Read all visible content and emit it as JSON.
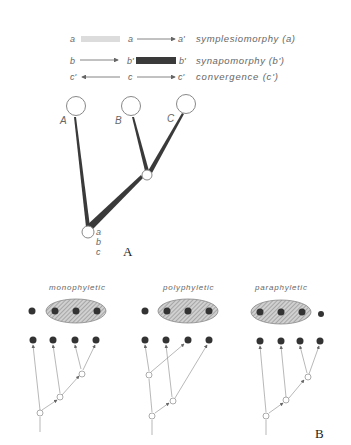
{
  "legend": {
    "rows": [
      {
        "left": "a",
        "mid": "a",
        "right": "a'",
        "term": "symplesiomorphy (a)"
      },
      {
        "left": "b",
        "mid": "b'",
        "right": "b'",
        "term": "synapomorphy (b')"
      },
      {
        "left": "c'",
        "mid": "c",
        "right": "c'",
        "term": "convergence (c')"
      }
    ]
  },
  "panel_a": {
    "label": "A",
    "taxa": [
      "A",
      "B",
      "C"
    ],
    "root_characters": [
      "a",
      "b",
      "c"
    ]
  },
  "panel_b": {
    "label": "B",
    "groups": [
      {
        "title": "monophyletic"
      },
      {
        "title": "polyphyletic"
      },
      {
        "title": "paraphyletic"
      }
    ]
  },
  "colors": {
    "symplesiomorphy_bar": "#d8d8d8",
    "synapomorphy_bar": "#3a3a3a",
    "hatch_fill": "#bdbdbd",
    "dot": "#333333",
    "line": "#777777"
  }
}
